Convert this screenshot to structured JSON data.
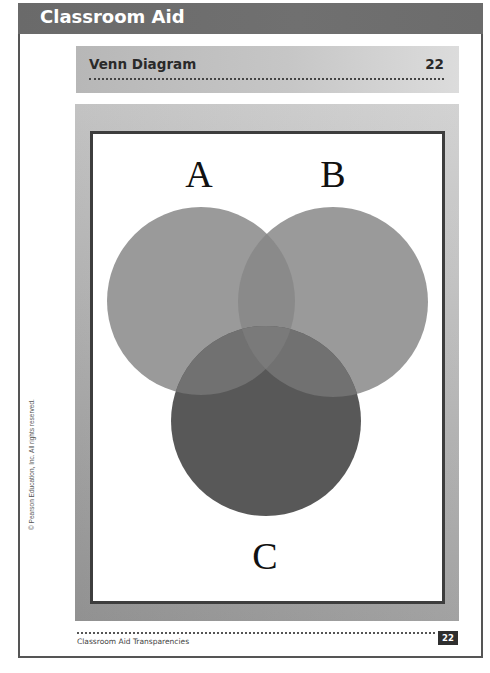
{
  "header": {
    "banner_title": "Classroom Aid"
  },
  "titlebar": {
    "title": "Venn Diagram",
    "number": "22"
  },
  "diagram": {
    "type": "venn",
    "sets": [
      {
        "label": "A",
        "cx": 201,
        "cy": 301,
        "r": 94,
        "fill": "#8f8f8f",
        "opacity": 0.85
      },
      {
        "label": "B",
        "cx": 333,
        "cy": 302,
        "r": 95,
        "fill": "#8f8f8f",
        "opacity": 0.85
      },
      {
        "label": "C",
        "cx": 266,
        "cy": 421,
        "r": 95,
        "fill": "#505050",
        "opacity": 0.85
      }
    ],
    "labels": {
      "a": "A",
      "b": "B",
      "c": "C"
    }
  },
  "side_note": {
    "copyright": "© Pearson Education, Inc. All rights reserved."
  },
  "footer": {
    "text": "Classroom Aid Transparencies",
    "page_number": "22"
  }
}
